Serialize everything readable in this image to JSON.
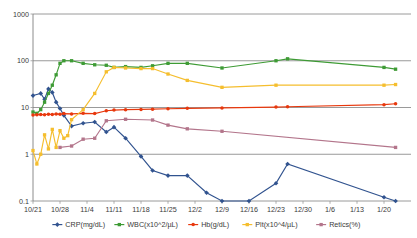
{
  "chart_data": {
    "type": "line",
    "title": "",
    "xlabel": "",
    "ylabel": "",
    "yscale": "log",
    "ylim": [
      0.1,
      1000
    ],
    "ytick_labels": [
      "1000",
      "100",
      "10",
      "1",
      "0.1"
    ],
    "ytick_values": [
      1000,
      100,
      10,
      1,
      0.1
    ],
    "grid": true,
    "legend_position": "bottom",
    "categories": [
      "10/21",
      "10/28",
      "11/4",
      "11/11",
      "11/18",
      "11/25",
      "12/2",
      "12/9",
      "12/16",
      "12/23",
      "12/30",
      "1/6",
      "1/13",
      "1/20"
    ],
    "xlim_days": [
      0,
      98
    ],
    "series": [
      {
        "name": "CRP(mg/dL)",
        "color": "#31538F",
        "marker": "diamond",
        "points": [
          {
            "x": 0,
            "y": 18
          },
          {
            "x": 2,
            "y": 20
          },
          {
            "x": 3,
            "y": 15
          },
          {
            "x": 4,
            "y": 25
          },
          {
            "x": 5,
            "y": 21
          },
          {
            "x": 6,
            "y": 13
          },
          {
            "x": 7,
            "y": 9.5
          },
          {
            "x": 8,
            "y": 6.8
          },
          {
            "x": 10,
            "y": 4.0
          },
          {
            "x": 13,
            "y": 4.6
          },
          {
            "x": 16,
            "y": 4.9
          },
          {
            "x": 19,
            "y": 3.0
          },
          {
            "x": 21,
            "y": 3.8
          },
          {
            "x": 24,
            "y": 2.2
          },
          {
            "x": 28,
            "y": 0.9
          },
          {
            "x": 31,
            "y": 0.45
          },
          {
            "x": 35,
            "y": 0.35
          },
          {
            "x": 40,
            "y": 0.35
          },
          {
            "x": 45,
            "y": 0.15
          },
          {
            "x": 49,
            "y": 0.1
          },
          {
            "x": 56,
            "y": 0.1
          },
          {
            "x": 63,
            "y": 0.24
          },
          {
            "x": 66,
            "y": 0.62
          },
          {
            "x": 91,
            "y": 0.12
          },
          {
            "x": 94,
            "y": 0.1
          }
        ]
      },
      {
        "name": "WBC(x10^2/µL)",
        "color": "#3E9B35",
        "marker": "square",
        "points": [
          {
            "x": 0,
            "y": 8.0
          },
          {
            "x": 1,
            "y": 7.5
          },
          {
            "x": 2,
            "y": 9.0
          },
          {
            "x": 3,
            "y": 13
          },
          {
            "x": 4,
            "y": 20
          },
          {
            "x": 5,
            "y": 30
          },
          {
            "x": 6,
            "y": 50
          },
          {
            "x": 7,
            "y": 88
          },
          {
            "x": 8,
            "y": 100
          },
          {
            "x": 10,
            "y": 100
          },
          {
            "x": 13,
            "y": 88
          },
          {
            "x": 16,
            "y": 82
          },
          {
            "x": 19,
            "y": 80
          },
          {
            "x": 21,
            "y": 72
          },
          {
            "x": 24,
            "y": 75
          },
          {
            "x": 28,
            "y": 72
          },
          {
            "x": 31,
            "y": 78
          },
          {
            "x": 35,
            "y": 88
          },
          {
            "x": 40,
            "y": 88
          },
          {
            "x": 49,
            "y": 70
          },
          {
            "x": 63,
            "y": 100
          },
          {
            "x": 66,
            "y": 110
          },
          {
            "x": 91,
            "y": 72
          },
          {
            "x": 94,
            "y": 66
          }
        ]
      },
      {
        "name": "Hb(g/dL)",
        "color": "#E8380D",
        "marker": "circle",
        "points": [
          {
            "x": 0,
            "y": 6.9
          },
          {
            "x": 1,
            "y": 7.0
          },
          {
            "x": 2,
            "y": 7.1
          },
          {
            "x": 3,
            "y": 7.0
          },
          {
            "x": 4,
            "y": 7.2
          },
          {
            "x": 5,
            "y": 7.1
          },
          {
            "x": 6,
            "y": 7.3
          },
          {
            "x": 7,
            "y": 7.2
          },
          {
            "x": 8,
            "y": 7.4
          },
          {
            "x": 10,
            "y": 7.3
          },
          {
            "x": 13,
            "y": 7.5
          },
          {
            "x": 16,
            "y": 7.4
          },
          {
            "x": 19,
            "y": 8.5
          },
          {
            "x": 21,
            "y": 8.8
          },
          {
            "x": 24,
            "y": 9.0
          },
          {
            "x": 28,
            "y": 9.1
          },
          {
            "x": 31,
            "y": 9.2
          },
          {
            "x": 35,
            "y": 9.4
          },
          {
            "x": 40,
            "y": 9.6
          },
          {
            "x": 49,
            "y": 9.8
          },
          {
            "x": 63,
            "y": 10.2
          },
          {
            "x": 66,
            "y": 10.4
          },
          {
            "x": 91,
            "y": 11.5
          },
          {
            "x": 94,
            "y": 12.0
          }
        ]
      },
      {
        "name": "Plt(x10^4/µL)",
        "color": "#F5BE2E",
        "marker": "square",
        "points": [
          {
            "x": 0,
            "y": 1.2
          },
          {
            "x": 1,
            "y": 0.62
          },
          {
            "x": 2,
            "y": 1.0
          },
          {
            "x": 3,
            "y": 2.6
          },
          {
            "x": 4,
            "y": 1.3
          },
          {
            "x": 5,
            "y": 3.4
          },
          {
            "x": 6,
            "y": 1.4
          },
          {
            "x": 7,
            "y": 3.2
          },
          {
            "x": 8,
            "y": 2.2
          },
          {
            "x": 9,
            "y": 2.5
          },
          {
            "x": 10,
            "y": 5.5
          },
          {
            "x": 13,
            "y": 9.0
          },
          {
            "x": 16,
            "y": 20
          },
          {
            "x": 19,
            "y": 58
          },
          {
            "x": 21,
            "y": 72
          },
          {
            "x": 24,
            "y": 70
          },
          {
            "x": 28,
            "y": 68
          },
          {
            "x": 31,
            "y": 68
          },
          {
            "x": 35,
            "y": 52
          },
          {
            "x": 40,
            "y": 38
          },
          {
            "x": 49,
            "y": 27
          },
          {
            "x": 63,
            "y": 30
          },
          {
            "x": 91,
            "y": 30
          },
          {
            "x": 94,
            "y": 31
          }
        ]
      },
      {
        "name": "Retics(%)",
        "color": "#B3758B",
        "marker": "square",
        "points": [
          {
            "x": 7,
            "y": 1.4
          },
          {
            "x": 10,
            "y": 1.5
          },
          {
            "x": 13,
            "y": 2.1
          },
          {
            "x": 16,
            "y": 2.2
          },
          {
            "x": 19,
            "y": 5.2
          },
          {
            "x": 24,
            "y": 5.6
          },
          {
            "x": 31,
            "y": 5.4
          },
          {
            "x": 35,
            "y": 4.2
          },
          {
            "x": 40,
            "y": 3.5
          },
          {
            "x": 49,
            "y": 3.1
          },
          {
            "x": 94,
            "y": 1.4
          }
        ]
      }
    ]
  },
  "legend": {
    "items": [
      {
        "label": "CRP(mg/dL)",
        "color": "#31538F",
        "marker": "diamond"
      },
      {
        "label": "WBC(x10^2/µL)",
        "color": "#3E9B35",
        "marker": "square"
      },
      {
        "label": "Hb(g/dL)",
        "color": "#E8380D",
        "marker": "circle"
      },
      {
        "label": "Plt(x10^4/µL)",
        "color": "#F5BE2E",
        "marker": "square"
      },
      {
        "label": "Retics(%)",
        "color": "#B3758B",
        "marker": "square"
      }
    ]
  }
}
